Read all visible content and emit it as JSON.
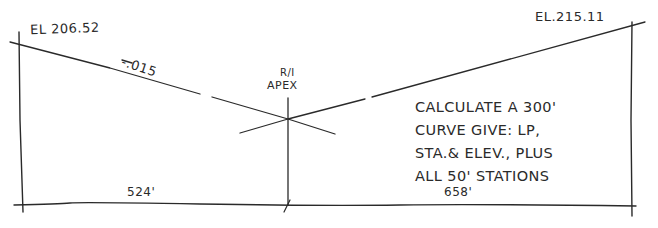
{
  "diagram": {
    "type": "vertical-curve-sketch",
    "style": "hand-drawn",
    "ink_color": "#2a2a2a",
    "background": "#ffffff"
  },
  "labels": {
    "elevation_left": "EL 206.52",
    "elevation_right": "EL.215.11",
    "grade_left": "-.015",
    "apex_line1": "R/I",
    "apex_line2": "APEX",
    "length_left": "524'",
    "length_right": "658'"
  },
  "note": {
    "lines": [
      "CALCULATE A 300'",
      "CURVE  GIVE: LP,",
      "STA.& ELEV., PLUS",
      "ALL 50' STATIONS"
    ]
  },
  "geometry": {
    "baseline": {
      "x1": 14,
      "y1": 205,
      "x2": 636,
      "y2": 206
    },
    "left_vertical": {
      "x": 20,
      "y_top": 30,
      "y_bottom": 213
    },
    "right_vertical": {
      "x": 632,
      "y_top": 20,
      "y_bottom": 216
    },
    "apex": {
      "x": 288,
      "y": 119
    },
    "left_grade_line": {
      "x1": 10,
      "y1": 42,
      "x2": 288,
      "y2": 119
    },
    "right_grade_line": {
      "x1": 288,
      "y1": 119,
      "x2": 645,
      "y2": 22
    },
    "apex_vertical": {
      "x": 288,
      "y_top": 98,
      "y_bottom": 205
    }
  }
}
